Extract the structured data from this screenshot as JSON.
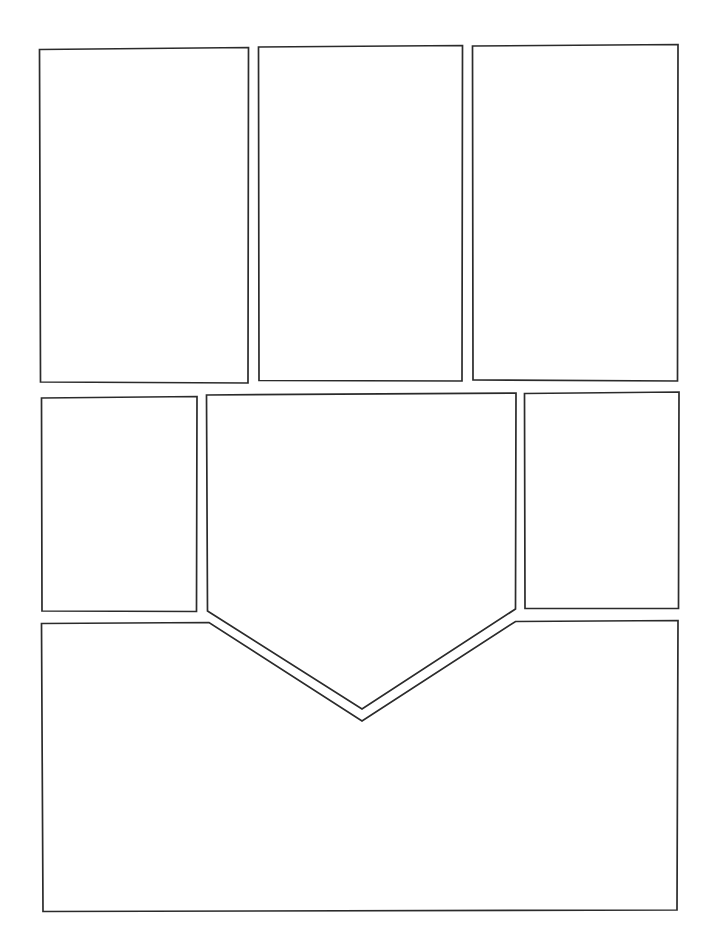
{
  "document": {
    "kind": "comic-page-layout-template",
    "title": "Blank Comic Page Layout",
    "page_width": 714,
    "page_height": 945,
    "background_color": "#ffffff",
    "ink_color": "#2b2b2b",
    "line_width": 1.7,
    "panel_count": 7,
    "rows": 3,
    "text_content": "",
    "annotations": []
  },
  "panels": [
    {
      "id": "panel-1",
      "row": 1,
      "position": "top-left",
      "shape": "rectangle",
      "label": "",
      "points": "39.5,49.5 248.5,47.5 248.0,383.0 40.5,382.0"
    },
    {
      "id": "panel-2",
      "row": 1,
      "position": "top-center",
      "shape": "rectangle",
      "label": "",
      "points": "258.5,47.0 462.5,45.5 462.0,381.0 259.0,380.5"
    },
    {
      "id": "panel-3",
      "row": 1,
      "position": "top-right",
      "shape": "rectangle",
      "label": "",
      "points": "472.5,46.0 678.0,44.5 677.5,381.0 473.0,380.0"
    },
    {
      "id": "panel-4",
      "row": 2,
      "position": "middle-left",
      "shape": "rectangle",
      "label": "",
      "points": "41.5,398.0 197.0,396.5 196.5,611.5 42.0,611.0"
    },
    {
      "id": "panel-5",
      "row": 2,
      "position": "middle-center",
      "shape": "pentagon-notched-bottom",
      "label": "",
      "points": "206.5,395.0 516.0,393.0 515.5,609.0 362.0,709.0 207.5,611.0"
    },
    {
      "id": "panel-6",
      "row": 2,
      "position": "middle-right",
      "shape": "rectangle",
      "label": "",
      "points": "524.5,393.5 679.0,392.0 678.5,608.5 525.0,608.5"
    },
    {
      "id": "panel-7",
      "row": 3,
      "position": "bottom-wide",
      "shape": "rectangle-with-v-notch-top",
      "label": "",
      "points": "41.5,623.5 209.0,622.5 362.0,721.0 515.5,621.5 678.0,620.5 677.0,910.0 43.0,911.5"
    }
  ]
}
